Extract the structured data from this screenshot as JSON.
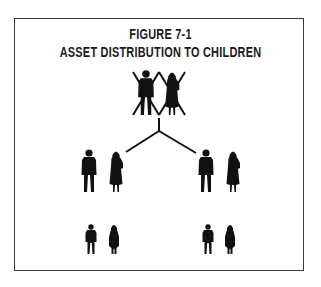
{
  "figure": {
    "number_label": "FIGURE 7-1",
    "title": "ASSET DISTRIBUTION TO CHILDREN"
  },
  "diagram": {
    "parents": {
      "description": "deceased parents (crossed out)",
      "count": 2
    },
    "branches": 2,
    "adult_children": [
      {
        "side": "left",
        "figures": [
          "man",
          "woman"
        ]
      },
      {
        "side": "right",
        "figures": [
          "man",
          "woman"
        ]
      }
    ],
    "grandchildren": [
      {
        "side": "left",
        "figures": [
          "boy",
          "girl"
        ]
      },
      {
        "side": "right",
        "figures": [
          "boy",
          "girl"
        ]
      }
    ],
    "colors": {
      "ink": "#111111",
      "border": "#3a3a3a",
      "background": "#ffffff"
    }
  }
}
